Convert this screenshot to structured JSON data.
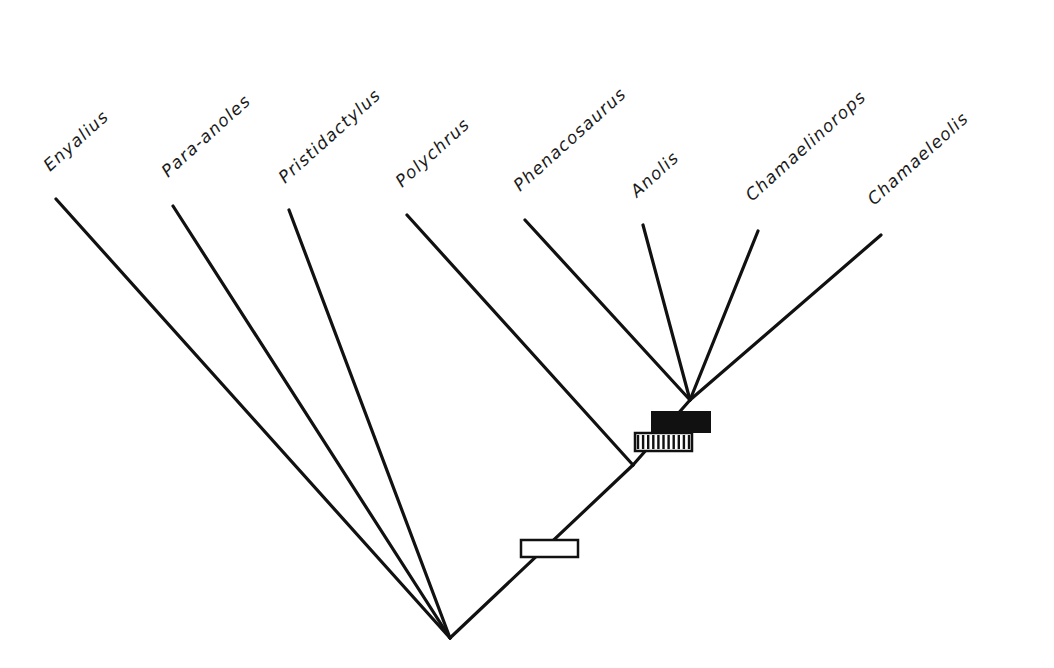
{
  "diagram": {
    "type": "phylogenetic-tree",
    "root": {
      "x": 450,
      "y": 638
    },
    "colors": {
      "line": "#111111",
      "text": "#1a1a1a",
      "background": "#ffffff"
    },
    "taxa": [
      {
        "label": "Enyalius",
        "tip": {
          "x": 56,
          "y": 199
        },
        "label_pos": {
          "x": 50,
          "y": 172
        }
      },
      {
        "label": "Para-anoles",
        "tip": {
          "x": 173,
          "y": 206
        },
        "label_pos": {
          "x": 168,
          "y": 178
        }
      },
      {
        "label": "Pristidactylus",
        "tip": {
          "x": 289,
          "y": 210
        },
        "label_pos": {
          "x": 285,
          "y": 184
        }
      },
      {
        "label": "Polychrus",
        "tip": {
          "x": 407,
          "y": 215
        },
        "label_pos": {
          "x": 402,
          "y": 188
        }
      },
      {
        "label": "Phenacosaurus",
        "tip": {
          "x": 525,
          "y": 220
        },
        "label_pos": {
          "x": 520,
          "y": 192
        }
      },
      {
        "label": "Anolis",
        "tip": {
          "x": 643,
          "y": 225
        },
        "label_pos": {
          "x": 637,
          "y": 198
        }
      },
      {
        "label": "Chamaelinorops",
        "tip": {
          "x": 758,
          "y": 231
        },
        "label_pos": {
          "x": 752,
          "y": 202
        }
      },
      {
        "label": "Chamaeleolis",
        "tip": {
          "x": 881,
          "y": 235
        },
        "label_pos": {
          "x": 874,
          "y": 206
        }
      }
    ],
    "internal_nodes": {
      "polychrus_split": {
        "x": 633,
        "y": 465
      },
      "anole_crown": {
        "x": 690,
        "y": 400
      }
    },
    "markers": [
      {
        "name": "open-character-bar",
        "style": "open",
        "x": 521,
        "y": 540,
        "w": 57,
        "h": 17
      },
      {
        "name": "hatched-character-bar",
        "style": "hatched",
        "x": 635,
        "y": 433,
        "w": 57,
        "h": 18,
        "bars": 10
      },
      {
        "name": "solid-character-bar",
        "style": "solid",
        "x": 652,
        "y": 412,
        "w": 58,
        "h": 20
      }
    ]
  }
}
